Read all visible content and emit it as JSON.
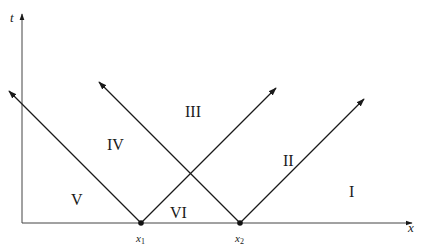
{
  "diagram": {
    "type": "characteristics-diagram",
    "axes": {
      "vertical_label": "t",
      "horizontal_label": "x"
    },
    "points": [
      {
        "label": "x",
        "subscript": "1"
      },
      {
        "label": "x",
        "subscript": "2"
      }
    ],
    "regions": [
      "I",
      "II",
      "III",
      "IV",
      "V",
      "VI"
    ],
    "colors": {
      "line": "#1a1a1a",
      "axis": "#555555",
      "background": "#ffffff"
    }
  }
}
